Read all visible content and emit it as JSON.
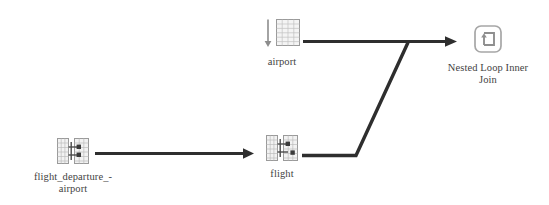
{
  "diagram": {
    "type": "query-execution-plan",
    "background_color": "#ffffff",
    "line_color": "#2e2e2e",
    "text_color": "#43423f"
  },
  "nodes": [
    {
      "id": "flight_departure_airport",
      "icon": "index-seek-icon",
      "label": "flight_departure_-\nairport"
    },
    {
      "id": "flight",
      "icon": "index-seek-icon",
      "label": "flight"
    },
    {
      "id": "airport",
      "icon": "table-scan-icon",
      "label": "airport"
    },
    {
      "id": "nested_loop_inner_join",
      "icon": "nested-loop-join-icon",
      "label": "Nested Loop Inner\nJoin"
    }
  ],
  "edges": [
    {
      "id": "edge-flight-departure-airport-to-flight",
      "from": "flight_departure_airport",
      "to": "flight",
      "arrowhead": true
    },
    {
      "id": "edge-airport-to-join",
      "from": "airport",
      "to": "nested_loop_inner_join",
      "arrowhead": true
    },
    {
      "id": "edge-flight-to-join",
      "from": "flight",
      "to": "nested_loop_inner_join",
      "arrowhead": false
    }
  ]
}
